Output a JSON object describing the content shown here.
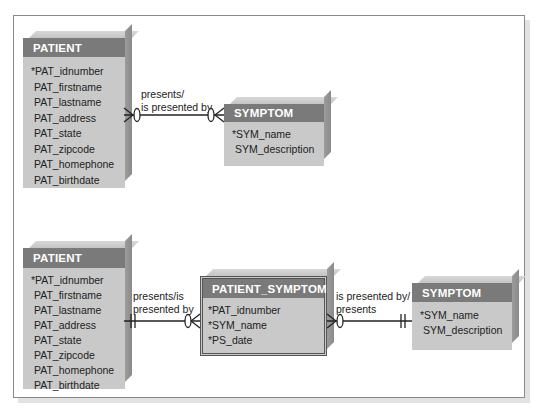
{
  "top_diagram": {
    "patient": {
      "title": "PATIENT",
      "attributes": [
        "*PAT_idnumber",
        "PAT_firstname",
        "PAT_lastname",
        "PAT_address",
        "PAT_state",
        "PAT_zipcode",
        "PAT_homephone",
        "PAT_birthdate"
      ]
    },
    "symptom": {
      "title": "SYMPTOM",
      "attributes": [
        "*SYM_name",
        "SYM_description"
      ]
    },
    "relationship": {
      "label_line1": "presents/",
      "label_line2": "is presented by",
      "left_cardinality": "zero-or-many",
      "right_cardinality": "zero-or-many"
    }
  },
  "bottom_diagram": {
    "patient": {
      "title": "PATIENT",
      "attributes": [
        "*PAT_idnumber",
        "PAT_firstname",
        "PAT_lastname",
        "PAT_address",
        "PAT_state",
        "PAT_zipcode",
        "PAT_homephone",
        "PAT_birthdate"
      ]
    },
    "patient_symptom": {
      "title": "PATIENT_SYMPTOM",
      "attributes": [
        "*PAT_idnumber",
        "*SYM_name",
        "*PS_date"
      ]
    },
    "symptom": {
      "title": "SYMPTOM",
      "attributes": [
        "*SYM_name",
        "SYM_description"
      ]
    },
    "relationship_left": {
      "label_line1": "presents/is",
      "label_line2": "presented by",
      "left_cardinality": "exactly-one",
      "right_cardinality": "zero-or-many"
    },
    "relationship_right": {
      "label_line1": "is presented by/",
      "label_line2": "presents",
      "left_cardinality": "zero-or-many",
      "right_cardinality": "exactly-one"
    }
  },
  "colors": {
    "header": "#7a7a7a",
    "body": "#c9c9c9",
    "line": "#222222"
  }
}
